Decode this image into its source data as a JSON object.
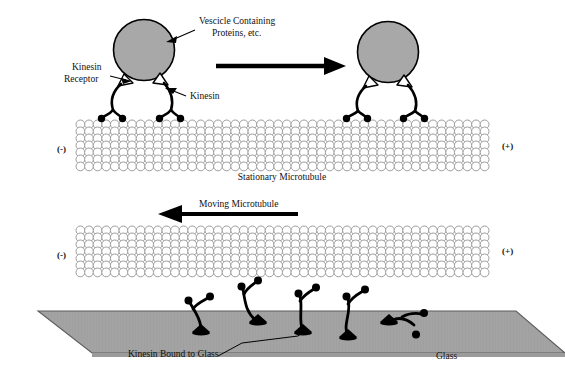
{
  "figure": {
    "title_present": false,
    "background_color": "#ffffff",
    "width": 565,
    "height": 389
  },
  "colors": {
    "vesicle_fill": "#a8a8a8",
    "vesicle_stroke": "#000000",
    "microtubule_stroke": "#9a9a9a",
    "microtubule_fill": "#ffffff",
    "kinesin_stroke": "#000000",
    "kinesin_head_fill": "#000000",
    "receptor_fill": "#ffffff",
    "glass_fill": "#a0a0a0",
    "glass_stroke": "#555555",
    "arrow_fill": "#000000",
    "text_color": "#111111"
  },
  "panels": {
    "top": {
      "name": "stationary-microtubule-panel",
      "caption": "Stationary Microtubule",
      "minus_end_label": "(-)",
      "plus_end_label": "(+)",
      "motion_arrow_direction": "right",
      "annotations": [
        {
          "id": "vesicle",
          "label": "Vescicle Containing\nProteins, etc.",
          "line1": "Vescicle Containing",
          "line2": "Proteins, etc."
        },
        {
          "id": "kinesin-receptor",
          "label": "Kinesin\nReceptor",
          "line1": "Kinesin",
          "line2": "Receptor"
        },
        {
          "id": "kinesin",
          "label": "Kinesin",
          "line1": "Kinesin"
        }
      ],
      "vesicle_count": 2,
      "kinesin_motors_per_vesicle": 2
    },
    "bottom": {
      "name": "gliding-assay-panel",
      "motion_arrow_label": "Moving Microtubule",
      "motion_arrow_direction": "left",
      "minus_end_label": "(-)",
      "plus_end_label": "(+)",
      "substrate_label": "Glass",
      "bound_motors_label": "Kinesin Bound to Glass",
      "bound_motor_count": 5
    }
  },
  "chart_data": {
    "type": "diagram",
    "elements": [
      "vesicle",
      "kinesin receptor",
      "kinesin motor",
      "microtubule lattice",
      "glass substrate"
    ]
  }
}
